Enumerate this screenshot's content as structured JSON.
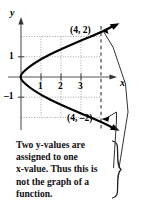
{
  "figure": {
    "title_semantic": "graph-failing-vertical-line-test",
    "axes": {
      "x_axis_label": "x",
      "y_axis_label": "y",
      "x_ticks": [
        "1",
        "2",
        "3"
      ],
      "y_ticks": [
        "1",
        "-1"
      ],
      "y_tick_negative_glyph": "–1"
    },
    "points": [
      {
        "label": "(4, 2)",
        "x": 4,
        "y": 2
      },
      {
        "label": "(4, –2)",
        "x": 4,
        "y": -2
      }
    ],
    "curve": {
      "kind": "sideways-parabola",
      "equation": "x = y^2",
      "opens": "right",
      "vertex": [
        0,
        0
      ],
      "arrowheads": [
        "upper-right",
        "lower-right"
      ]
    },
    "gridlines": {
      "style": "dotted",
      "horizontal_at": [
        2,
        1,
        -1,
        -2
      ],
      "vertical_at": [
        1,
        2,
        3
      ],
      "dashed_vertical_at": [
        4
      ]
    },
    "colors": {
      "ink": "#000000",
      "grid": "#8a8a8a",
      "background": "#ffffff"
    }
  },
  "caption": {
    "lines": [
      "Two y-values are",
      "assigned to one",
      "x-value. Thus this is",
      "not the graph of a",
      "function."
    ],
    "full_text": "Two y-values are assigned to one x-value. Thus this is not the graph of a function."
  },
  "callout": {
    "brace_glyph": "}",
    "leader_lines": 2
  }
}
